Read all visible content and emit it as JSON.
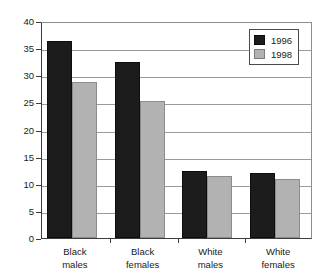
{
  "chart_data": {
    "type": "bar",
    "title": "",
    "subtitle": "",
    "xlabel": "",
    "ylabel": "",
    "categories": [
      "Black males",
      "Black females",
      "White males",
      "White females"
    ],
    "category_lines": [
      [
        "Black",
        "males"
      ],
      [
        "Black",
        "females"
      ],
      [
        "White",
        "males"
      ],
      [
        "White",
        "females"
      ]
    ],
    "series": [
      {
        "name": "1996",
        "color": "#1c1c1c",
        "values": [
          36.4,
          32.5,
          12.4,
          11.9
        ]
      },
      {
        "name": "1998",
        "color": "#b2b2b2",
        "values": [
          28.8,
          25.3,
          11.5,
          10.8
        ]
      }
    ],
    "ylim": [
      0,
      40
    ],
    "ytick_step": 5,
    "yticks": [
      0,
      5,
      10,
      15,
      20,
      25,
      30,
      35,
      40
    ],
    "ytick_labels": [
      "0",
      "5",
      "10",
      "15",
      "20",
      "25",
      "30",
      "35",
      "40"
    ],
    "grid": true,
    "grid_axis": "y",
    "legend_position": "top-right",
    "legend_entries": [
      "1996",
      "1998"
    ]
  }
}
